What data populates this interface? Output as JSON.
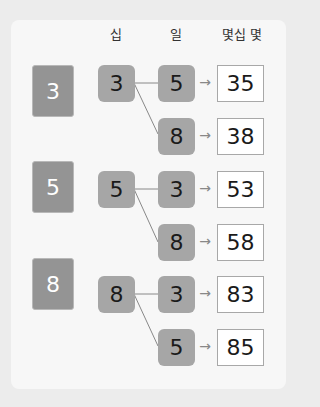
{
  "headers": {
    "tens": "십",
    "ones": "일",
    "result": "몇십 몇"
  },
  "colors": {
    "big_tile": "#949494",
    "small_tile": "#a6a6a6",
    "card": "#f7f7f7",
    "background": "#ececec",
    "line": "#888888"
  },
  "groups": [
    {
      "source": "3",
      "tens": "3",
      "ones": [
        "5",
        "8"
      ],
      "results": [
        "35",
        "38"
      ]
    },
    {
      "source": "5",
      "tens": "5",
      "ones": [
        "3",
        "8"
      ],
      "results": [
        "53",
        "58"
      ]
    },
    {
      "source": "8",
      "tens": "8",
      "ones": [
        "3",
        "5"
      ],
      "results": [
        "83",
        "85"
      ]
    }
  ],
  "arrow": "→"
}
